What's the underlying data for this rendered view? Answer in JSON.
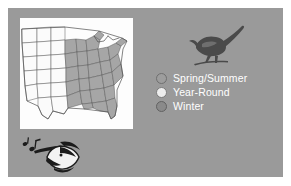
{
  "slide": {
    "background_color": "#9a9a9a",
    "page_background_color": "#ffffff"
  },
  "map": {
    "name": "united-states-range-map",
    "background_color": "#fdfdfd",
    "shaded_region_color": "#a6a6a6",
    "unshaded_region_color": "#fbfbfb",
    "border_color": "#555555",
    "description": "Map of the United States with eastern and southeastern states shaded"
  },
  "bird": {
    "name": "bird-silhouette",
    "color": "#4a4a4a",
    "description": "Dark silhouette of a perched songbird with long upturned tail"
  },
  "legend": {
    "items": [
      {
        "label": "Spring/Summer",
        "color": "#9d9d9d",
        "border_color": "#6f6f6f"
      },
      {
        "label": "Year-Round",
        "color": "#ededed",
        "border_color": "#7c7c7c"
      },
      {
        "label": "Winter",
        "color": "#8a8a8a",
        "border_color": "#626262"
      }
    ],
    "text_color": "#ffffff"
  },
  "logo": {
    "name": "singing-bird-head-logo",
    "dark_color": "#1c1c1c",
    "light_color": "#f2f2f2",
    "description": "Stylized singing bird head with open beak and music notes"
  }
}
